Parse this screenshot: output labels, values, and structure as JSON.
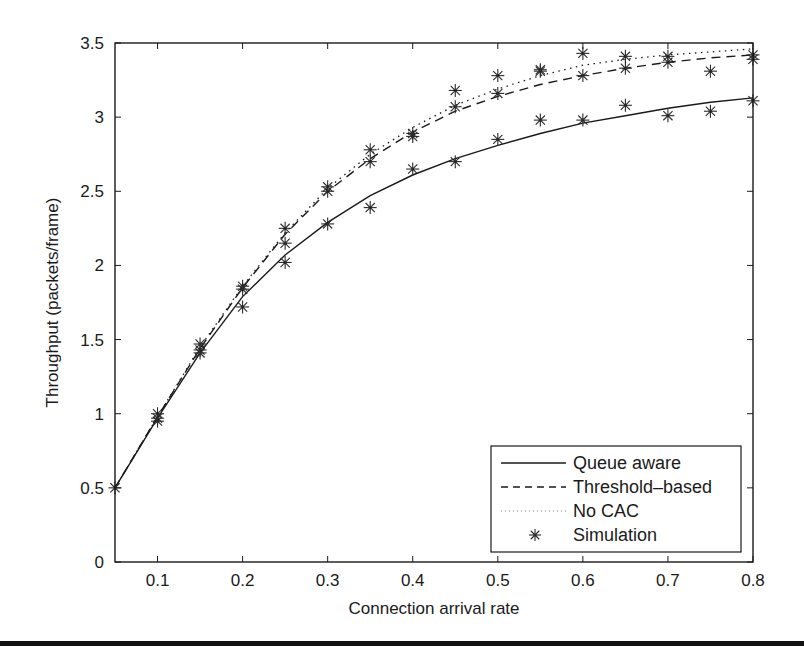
{
  "chart_data": {
    "type": "line",
    "title": "",
    "xlabel": "Connection arrival rate",
    "ylabel": "Throughput (packets/frame)",
    "xlim": [
      0.05,
      0.8
    ],
    "ylim": [
      0,
      3.5
    ],
    "xticks": [
      0.1,
      0.2,
      0.3,
      0.4,
      0.5,
      0.6,
      0.7,
      0.8
    ],
    "xtick_labels": [
      "0.1",
      "0.2",
      "0.3",
      "0.4",
      "0.5",
      "0.6",
      "0.7",
      "0.8"
    ],
    "yticks": [
      0,
      0.5,
      1,
      1.5,
      2,
      2.5,
      3,
      3.5
    ],
    "ytick_labels": [
      "0",
      "0.5",
      "1",
      "1.5",
      "2",
      "2.5",
      "3",
      "3.5"
    ],
    "grid": false,
    "legend_position": "lower right",
    "x": [
      0.05,
      0.1,
      0.15,
      0.2,
      0.25,
      0.3,
      0.35,
      0.4,
      0.45,
      0.5,
      0.55,
      0.6,
      0.65,
      0.7,
      0.75,
      0.8
    ],
    "series": [
      {
        "name": "Queue aware",
        "style": "solid",
        "values": [
          0.5,
          0.97,
          1.41,
          1.79,
          2.07,
          2.29,
          2.47,
          2.61,
          2.72,
          2.81,
          2.89,
          2.96,
          3.01,
          3.06,
          3.1,
          3.13
        ]
      },
      {
        "name": "Threshold-based",
        "style": "dashed",
        "values": [
          0.5,
          0.98,
          1.44,
          1.85,
          2.21,
          2.5,
          2.72,
          2.9,
          3.04,
          3.14,
          3.22,
          3.28,
          3.33,
          3.37,
          3.4,
          3.42
        ]
      },
      {
        "name": "No CAC",
        "style": "dotted",
        "values": [
          0.5,
          0.98,
          1.45,
          1.86,
          2.22,
          2.52,
          2.75,
          2.93,
          3.08,
          3.19,
          3.28,
          3.35,
          3.39,
          3.42,
          3.44,
          3.46
        ]
      },
      {
        "name": "Simulation",
        "style": "marker-asterisk",
        "points": [
          [
            0.05,
            0.5
          ],
          [
            0.1,
            0.95
          ],
          [
            0.1,
            0.97
          ],
          [
            0.1,
            1.0
          ],
          [
            0.15,
            1.41
          ],
          [
            0.15,
            1.43
          ],
          [
            0.15,
            1.47
          ],
          [
            0.2,
            1.72
          ],
          [
            0.2,
            1.84
          ],
          [
            0.2,
            1.86
          ],
          [
            0.25,
            2.02
          ],
          [
            0.25,
            2.15
          ],
          [
            0.25,
            2.25
          ],
          [
            0.3,
            2.28
          ],
          [
            0.3,
            2.5
          ],
          [
            0.3,
            2.53
          ],
          [
            0.35,
            2.39
          ],
          [
            0.35,
            2.7
          ],
          [
            0.35,
            2.78
          ],
          [
            0.4,
            2.65
          ],
          [
            0.4,
            2.87
          ],
          [
            0.4,
            2.89
          ],
          [
            0.45,
            2.7
          ],
          [
            0.45,
            3.07
          ],
          [
            0.45,
            3.18
          ],
          [
            0.5,
            2.85
          ],
          [
            0.5,
            3.16
          ],
          [
            0.5,
            3.28
          ],
          [
            0.55,
            2.98
          ],
          [
            0.55,
            3.31
          ],
          [
            0.55,
            3.32
          ],
          [
            0.6,
            2.98
          ],
          [
            0.6,
            3.28
          ],
          [
            0.6,
            3.43
          ],
          [
            0.65,
            3.08
          ],
          [
            0.65,
            3.33
          ],
          [
            0.65,
            3.41
          ],
          [
            0.7,
            3.01
          ],
          [
            0.7,
            3.37
          ],
          [
            0.7,
            3.41
          ],
          [
            0.75,
            3.04
          ],
          [
            0.75,
            3.31
          ],
          [
            0.8,
            3.11
          ],
          [
            0.8,
            3.39
          ],
          [
            0.8,
            3.42
          ]
        ]
      }
    ]
  },
  "legend": {
    "items": [
      {
        "label": "Queue aware",
        "style": "solid"
      },
      {
        "label": "Threshold–based",
        "style": "dashed"
      },
      {
        "label": "No CAC",
        "style": "dotted"
      },
      {
        "label": "Simulation",
        "style": "marker-asterisk"
      }
    ]
  },
  "colors": {
    "line": "#1a1a1a",
    "marker": "#2a2a2a",
    "axis": "#1a1a1a",
    "background": "#ffffff"
  }
}
